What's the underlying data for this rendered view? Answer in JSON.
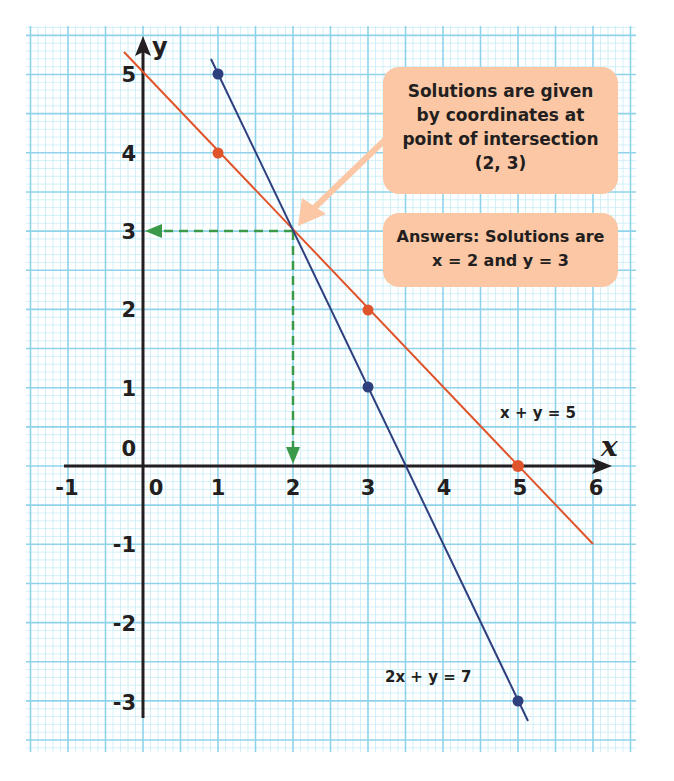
{
  "chart_data": {
    "type": "line",
    "title": "",
    "xlabel": "x",
    "ylabel": "y",
    "xlim": [
      -1,
      6
    ],
    "ylim": [
      -3,
      5
    ],
    "x_ticks": [
      "-1",
      "0",
      "1",
      "2",
      "3",
      "4",
      "5",
      "6"
    ],
    "y_ticks": [
      "5",
      "4",
      "3",
      "2",
      "1",
      "0",
      "-1",
      "-2",
      "-3"
    ],
    "grid": true,
    "series": [
      {
        "name": "x + y = 5",
        "color": "#e0542c",
        "points": [
          [
            1,
            4
          ],
          [
            3,
            2
          ],
          [
            5,
            0
          ]
        ],
        "line_extent": [
          [
            -0.25,
            5.25
          ],
          [
            6,
            -1
          ]
        ]
      },
      {
        "name": "2x + y = 7",
        "color": "#2e3f7e",
        "points": [
          [
            1,
            5
          ],
          [
            3,
            1
          ],
          [
            5,
            -3
          ]
        ],
        "line_extent": [
          [
            0.95,
            5.1
          ],
          [
            5.05,
            -3.1
          ]
        ]
      }
    ],
    "intersection": [
      2,
      3
    ],
    "annotations": [
      "Solutions are given by coordinates at point of intersection (2, 3)",
      "Answers: Solutions are x = 2 and y = 3"
    ]
  },
  "axes": {
    "x_label": "x",
    "y_label": "y",
    "x_tick_labels": [
      "-1",
      "0",
      "1",
      "2",
      "3",
      "4",
      "5",
      "6"
    ],
    "y_tick_labels": [
      "5",
      "4",
      "3",
      "2",
      "1",
      "0",
      "-1",
      "-2",
      "-3"
    ]
  },
  "labels": {
    "line1": "x + y = 5",
    "line2": "2x + y = 7"
  },
  "callout1": {
    "lines": [
      "Solutions are given",
      "by coordinates at",
      "point of intersection",
      "(2, 3)"
    ]
  },
  "callout2": {
    "lines": [
      "Answers: Solutions are",
      "x = 2 and y = 3"
    ]
  },
  "colors": {
    "grid_major": "#8fd3ea",
    "grid_minor": "#c6ecf6",
    "line1": "#e0542c",
    "line2": "#2e3f7e",
    "guide": "#3a9a4a",
    "callout": "#fbc7a4"
  }
}
